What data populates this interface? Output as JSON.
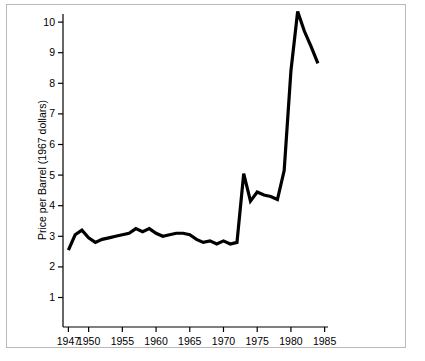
{
  "figure": {
    "border_color": "#b9b9b9",
    "background": "#ffffff",
    "line_color": "#000000"
  },
  "chart_data": {
    "type": "line",
    "title": "",
    "subtitle": "",
    "xlabel": "",
    "ylabel": "Price per Barrel (1967 dollars)",
    "xlim": [
      1946.2,
      1985.5
    ],
    "ylim": [
      0,
      10.8
    ],
    "grid": false,
    "legend": null,
    "legend_position": "none",
    "x_ticks": [
      1947,
      1950,
      1955,
      1960,
      1965,
      1970,
      1975,
      1980,
      1985
    ],
    "x_tick_labels": [
      "1947",
      "1950",
      "1955",
      "1960",
      "1965",
      "1970",
      "1975",
      "1980",
      "1985"
    ],
    "y_ticks": [
      1,
      2,
      3,
      4,
      5,
      6,
      7,
      8,
      9,
      10
    ],
    "y_tick_labels": [
      "1",
      "2",
      "3",
      "4",
      "5",
      "6",
      "7",
      "8",
      "9",
      "10"
    ],
    "series": [
      {
        "name": "Price per Barrel (1967 dollars)",
        "x": [
          1947,
          1948,
          1949,
          1950,
          1951,
          1952,
          1953,
          1954,
          1955,
          1956,
          1957,
          1958,
          1959,
          1960,
          1961,
          1962,
          1963,
          1964,
          1965,
          1966,
          1967,
          1968,
          1969,
          1970,
          1971,
          1972,
          1973,
          1974,
          1975,
          1976,
          1977,
          1978,
          1979,
          1980,
          1981,
          1982,
          1983,
          1984
        ],
        "values": [
          2.55,
          3.05,
          3.2,
          2.95,
          2.8,
          2.9,
          2.95,
          3.0,
          3.05,
          3.1,
          3.25,
          3.15,
          3.25,
          3.1,
          3.0,
          3.05,
          3.1,
          3.1,
          3.05,
          2.9,
          2.8,
          2.85,
          2.75,
          2.85,
          2.75,
          2.8,
          5.05,
          4.15,
          4.45,
          4.35,
          4.3,
          4.2,
          5.15,
          8.4,
          10.35,
          9.7,
          9.2,
          8.65
        ]
      }
    ]
  }
}
